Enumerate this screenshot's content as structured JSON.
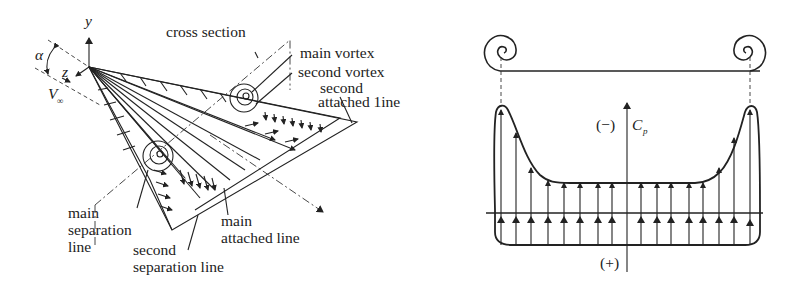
{
  "left_figure": {
    "title": "Delta wing leading-edge vortex flow",
    "axes": {
      "y": "y",
      "z": "z",
      "alpha": "α",
      "freestream": "V",
      "freestream_sub": "∞"
    },
    "labels": {
      "cross_section": "cross section",
      "main_vortex": "main vortex",
      "second_vortex": "second vortex",
      "second_attached_1": "second",
      "second_attached_2": "attached 1ine",
      "main_separation_1": "main",
      "main_separation_2": "separation",
      "main_separation_3": "line",
      "second_separation_1": "second",
      "second_separation_2": "separation line",
      "main_attached_1": "main",
      "main_attached_2": "attached line"
    }
  },
  "right_figure": {
    "title": "Spanwise pressure coefficient distribution",
    "axis_label": "C",
    "axis_sub": "p",
    "negative_label": "(−)",
    "positive_label": "(+)",
    "upper_arrow_x": [
      494,
      510,
      532,
      548,
      564,
      580,
      598,
      612,
      643,
      658,
      672,
      690,
      704,
      721,
      737,
      752
    ],
    "lower_arrow_count": 17
  },
  "colors": {
    "ink": "#222222",
    "background": "#ffffff"
  }
}
